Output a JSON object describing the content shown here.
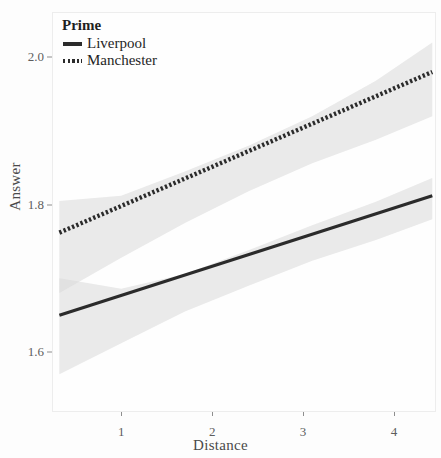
{
  "chart_data": {
    "type": "line",
    "title": "",
    "xlabel": "Distance",
    "ylabel": "Answer",
    "xlim": [
      0.25,
      4.45
    ],
    "ylim": [
      1.52,
      2.06
    ],
    "xticks": [
      1,
      2,
      3,
      4
    ],
    "xtick_labels": [
      "1",
      "2",
      "3",
      "4"
    ],
    "yticks": [
      1.6,
      1.8,
      2.0
    ],
    "ytick_labels": [
      "1.6",
      "1.8",
      "2.0"
    ],
    "grid": false,
    "legend": {
      "title": "Prime",
      "position": "top-left",
      "entries": [
        {
          "label": "Liverpool",
          "style": "solid"
        },
        {
          "label": "Manchester",
          "style": "dotted"
        }
      ]
    },
    "series": [
      {
        "name": "Liverpool",
        "style": "solid",
        "color": "#2b2b2b",
        "x": [
          0.32,
          4.42
        ],
        "y": [
          1.65,
          1.812
        ],
        "band": {
          "color": "#d8d8d8",
          "x": [
            0.32,
            1.0,
            1.7,
            2.4,
            3.1,
            3.8,
            4.42
          ],
          "upper": [
            1.7,
            1.686,
            1.706,
            1.738,
            1.772,
            1.804,
            1.836
          ],
          "lower": [
            1.57,
            1.612,
            1.655,
            1.69,
            1.724,
            1.752,
            1.78
          ]
        }
      },
      {
        "name": "Manchester",
        "style": "dotted",
        "color": "#2b2b2b",
        "x": [
          0.32,
          4.42
        ],
        "y": [
          1.762,
          1.98
        ],
        "band": {
          "color": "#d8d8d8",
          "x": [
            0.32,
            1.0,
            1.7,
            2.4,
            3.1,
            3.8,
            4.42
          ],
          "upper": [
            1.805,
            1.812,
            1.845,
            1.88,
            1.92,
            1.968,
            2.02
          ],
          "lower": [
            1.68,
            1.728,
            1.775,
            1.818,
            1.856,
            1.888,
            1.92
          ]
        }
      }
    ]
  }
}
